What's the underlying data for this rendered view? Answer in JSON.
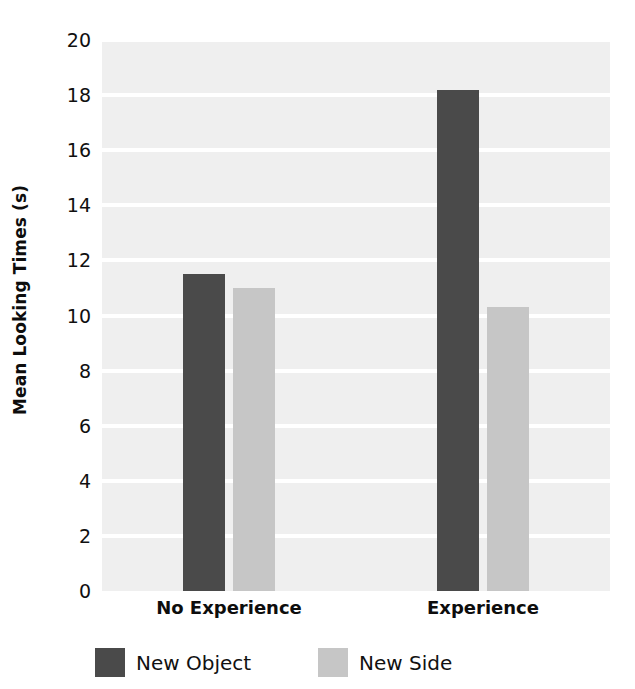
{
  "chart_data": {
    "type": "bar",
    "title": "",
    "subtitle": "",
    "xlabel": "",
    "ylabel": "Mean Looking Times (s)",
    "categories": [
      "No Experience",
      "Experience"
    ],
    "series": [
      {
        "name": "New Object",
        "color": "#4a4a4a",
        "values": [
          11.5,
          18.2
        ]
      },
      {
        "name": "New Side",
        "color": "#c6c6c6",
        "values": [
          11.0,
          10.3
        ]
      }
    ],
    "ylim": [
      0,
      20
    ],
    "ytick_step": 2,
    "yticks": [
      "20",
      "18",
      "16",
      "14",
      "12",
      "10",
      "8",
      "6",
      "4",
      "2",
      "0"
    ],
    "ytick_values": [
      20,
      18,
      16,
      14,
      12,
      10,
      8,
      6,
      4,
      2,
      0
    ],
    "grid": true,
    "grid_color": "#ffffff",
    "plot_background": "#efefef",
    "legend_position": "bottom",
    "legend": [
      {
        "label": "New Object",
        "color": "#4a4a4a"
      },
      {
        "label": "New Side",
        "color": "#c6c6c6"
      }
    ]
  }
}
